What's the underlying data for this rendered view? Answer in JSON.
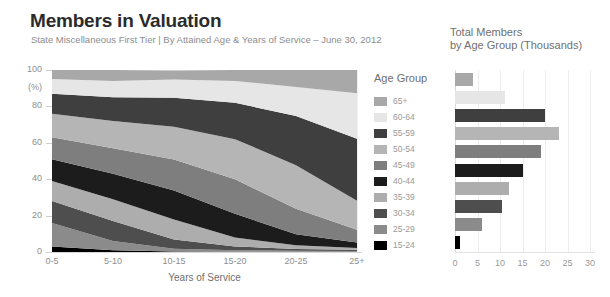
{
  "header": {
    "title": "Members in Valuation",
    "subtitle": "State Miscellaneous First Tier | By Attained Age & Years of Service – June 30, 2012"
  },
  "legend": {
    "title": "Age Group",
    "items": [
      {
        "label": "65+",
        "color": "#a8a8a8"
      },
      {
        "label": "60-64",
        "color": "#e6e6e6"
      },
      {
        "label": "55-59",
        "color": "#3f3f3f"
      },
      {
        "label": "50-54",
        "color": "#b5b5b5"
      },
      {
        "label": "45-49",
        "color": "#7e7e7e"
      },
      {
        "label": "40-44",
        "color": "#1c1c1c"
      },
      {
        "label": "35-39",
        "color": "#adadad"
      },
      {
        "label": "30-34",
        "color": "#4e4e4e"
      },
      {
        "label": "25-29",
        "color": "#8b8b8b"
      },
      {
        "label": "15-24",
        "color": "#000000"
      }
    ]
  },
  "bar_panel": {
    "title_line1": "Total Members",
    "title_line2": "by Age Group (Thousands)"
  },
  "chart_data": [
    {
      "type": "area",
      "title": "Members in Valuation",
      "subtitle": "State Miscellaneous First Tier | By Attained Age & Years of Service – June 30, 2012",
      "stacked": true,
      "normalized_percent": true,
      "xlabel": "Years of Service",
      "ylabel": "(%)",
      "ylim": [
        0,
        100
      ],
      "yticks": [
        0,
        20,
        40,
        60,
        80,
        100
      ],
      "ytick_labels": [
        "0",
        "20",
        "40",
        "60",
        "80",
        "100"
      ],
      "grid": false,
      "legend_position": "right",
      "categories": [
        "0-5",
        "5-10",
        "10-15",
        "15-20",
        "20-25",
        "25+"
      ],
      "series": [
        {
          "name": "15-24",
          "color": "#000000",
          "values": [
            3.0,
            1.0,
            0.3,
            0.2,
            0.2,
            0.2
          ]
        },
        {
          "name": "25-29",
          "color": "#8b8b8b",
          "values": [
            13.0,
            5.0,
            1.5,
            0.8,
            0.5,
            0.4
          ]
        },
        {
          "name": "30-34",
          "color": "#4e4e4e",
          "values": [
            12.0,
            11.0,
            5.0,
            2.0,
            1.0,
            0.6
          ]
        },
        {
          "name": "35-39",
          "color": "#adadad",
          "values": [
            11.0,
            12.0,
            11.0,
            5.0,
            2.0,
            1.0
          ]
        },
        {
          "name": "40-44",
          "color": "#1c1c1c",
          "values": [
            12.0,
            14.0,
            16.0,
            13.0,
            6.0,
            3.0
          ]
        },
        {
          "name": "45-49",
          "color": "#7e7e7e",
          "values": [
            12.0,
            14.0,
            17.0,
            19.0,
            14.0,
            7.0
          ]
        },
        {
          "name": "50-54",
          "color": "#b5b5b5",
          "values": [
            13.0,
            15.0,
            18.0,
            22.0,
            24.0,
            16.0
          ]
        },
        {
          "name": "55-59",
          "color": "#3f3f3f",
          "values": [
            11.0,
            13.0,
            16.0,
            20.0,
            27.0,
            34.0
          ]
        },
        {
          "name": "60-64",
          "color": "#e6e6e6",
          "values": [
            8.0,
            9.0,
            10.0,
            12.0,
            16.0,
            25.0
          ]
        },
        {
          "name": "65+",
          "color": "#a8a8a8",
          "values": [
            5.0,
            6.0,
            4.9,
            6.0,
            9.3,
            12.8
          ]
        }
      ]
    },
    {
      "type": "bar",
      "orientation": "horizontal",
      "title": "Total Members by Age Group (Thousands)",
      "xlabel": "",
      "ylabel": "",
      "xlim": [
        0,
        30
      ],
      "xticks": [
        0,
        5,
        10,
        15,
        20,
        25,
        30
      ],
      "xtick_labels": [
        "0",
        "5",
        "10",
        "15",
        "20",
        "25",
        "30"
      ],
      "grid": true,
      "categories": [
        "65+",
        "60-64",
        "55-59",
        "50-54",
        "45-49",
        "40-44",
        "35-39",
        "30-34",
        "25-29",
        "15-24"
      ],
      "values": [
        4.0,
        11.0,
        20.0,
        23.0,
        19.0,
        15.0,
        12.0,
        10.5,
        6.0,
        1.0
      ],
      "colors": [
        "#a8a8a8",
        "#e6e6e6",
        "#3f3f3f",
        "#b5b5b5",
        "#7e7e7e",
        "#1c1c1c",
        "#adadad",
        "#4e4e4e",
        "#8b8b8b",
        "#000000"
      ]
    }
  ]
}
